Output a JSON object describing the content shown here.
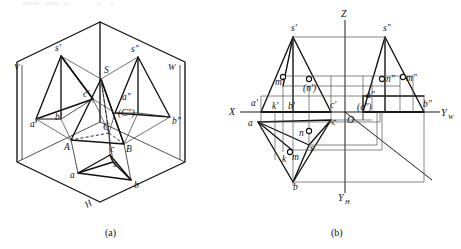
{
  "figure": {
    "captions": [
      {
        "id": "cap-a",
        "text": "(a)",
        "x": 112,
        "y": 233
      },
      {
        "id": "cap-b",
        "text": "(b)",
        "x": 338,
        "y": 233
      }
    ]
  },
  "panel_a": {
    "name": "pictorial-three-plane-view",
    "plane_labels": [
      {
        "id": "V",
        "text": "V",
        "x": 14,
        "y": 70
      },
      {
        "id": "W",
        "text": "W",
        "x": 170,
        "y": 70
      },
      {
        "id": "H",
        "text": "H",
        "x": 89,
        "y": 208
      }
    ],
    "point_labels": [
      {
        "id": "s-front",
        "text": "s'",
        "x": 56,
        "y": 51
      },
      {
        "id": "s-side",
        "text": "s\"",
        "x": 128,
        "y": 52
      },
      {
        "id": "S",
        "text": "S",
        "x": 103,
        "y": 72
      },
      {
        "id": "c-front",
        "text": "c'",
        "x": 82,
        "y": 98
      },
      {
        "id": "a-side",
        "text": "a\"",
        "x": 123,
        "y": 100
      },
      {
        "id": "c-side",
        "text": "(C\")",
        "x": 122,
        "y": 115
      },
      {
        "id": "a-front",
        "text": "a'",
        "x": 35,
        "y": 124
      },
      {
        "id": "b-front",
        "text": "b'",
        "x": 56,
        "y": 120
      },
      {
        "id": "C",
        "text": "C",
        "x": 104,
        "y": 127
      },
      {
        "id": "b-side",
        "text": "b\"",
        "x": 173,
        "y": 122
      },
      {
        "id": "A",
        "text": "A",
        "x": 66,
        "y": 148
      },
      {
        "id": "B",
        "text": "B",
        "x": 125,
        "y": 150
      },
      {
        "id": "c-top",
        "text": "c",
        "x": 110,
        "y": 150
      },
      {
        "id": "s-top",
        "text": "s",
        "x": 112,
        "y": 166
      },
      {
        "id": "a-top",
        "text": "a",
        "x": 73,
        "y": 179
      },
      {
        "id": "b-top",
        "text": "b",
        "x": 135,
        "y": 186
      }
    ]
  },
  "panel_b": {
    "name": "orthographic-three-view",
    "axis_labels": [
      {
        "id": "Z",
        "text": "Z",
        "x": 341,
        "y": 17
      },
      {
        "id": "X",
        "text": "X",
        "x": 229,
        "y": 114
      },
      {
        "id": "YW",
        "text": "Y",
        "sub": "W",
        "x": 443,
        "y": 116
      },
      {
        "id": "YH",
        "text": "Y",
        "sub": "H",
        "x": 340,
        "y": 200
      },
      {
        "id": "O",
        "text": "O",
        "x": 347,
        "y": 122
      }
    ],
    "point_labels": [
      {
        "id": "s-front",
        "text": "s'",
        "x": 294,
        "y": 29
      },
      {
        "id": "s-side",
        "text": "s\"",
        "x": 384,
        "y": 29
      },
      {
        "id": "m-front",
        "text": "m'",
        "x": 281,
        "y": 82
      },
      {
        "id": "n-front",
        "text": "(n')",
        "x": 310,
        "y": 89
      },
      {
        "id": "n-side",
        "text": "n\"",
        "x": 390,
        "y": 82
      },
      {
        "id": "m-side",
        "text": "m\"",
        "x": 407,
        "y": 80
      },
      {
        "id": "a-front",
        "text": "a'",
        "x": 255,
        "y": 104
      },
      {
        "id": "k-front",
        "text": "k'",
        "x": 275,
        "y": 107
      },
      {
        "id": "b-front",
        "text": "b'",
        "x": 294,
        "y": 107
      },
      {
        "id": "c-front",
        "text": "c'",
        "x": 335,
        "y": 105
      },
      {
        "id": "a-side",
        "text": "a\"",
        "x": 370,
        "y": 96
      },
      {
        "id": "c-side",
        "text": "(c\")",
        "x": 363,
        "y": 108
      },
      {
        "id": "b-side",
        "text": "b\"",
        "x": 424,
        "y": 104
      },
      {
        "id": "a-top",
        "text": "a",
        "x": 250,
        "y": 126
      },
      {
        "id": "c-top",
        "text": "c",
        "x": 333,
        "y": 123
      },
      {
        "id": "n-top",
        "text": "n",
        "x": 303,
        "y": 136
      },
      {
        "id": "s-top",
        "text": "s",
        "x": 311,
        "y": 150
      },
      {
        "id": "m-top",
        "text": "m",
        "x": 296,
        "y": 158
      },
      {
        "id": "k-top",
        "text": "k",
        "x": 285,
        "y": 160
      },
      {
        "id": "b-top",
        "text": "b",
        "x": 297,
        "y": 187
      }
    ]
  }
}
